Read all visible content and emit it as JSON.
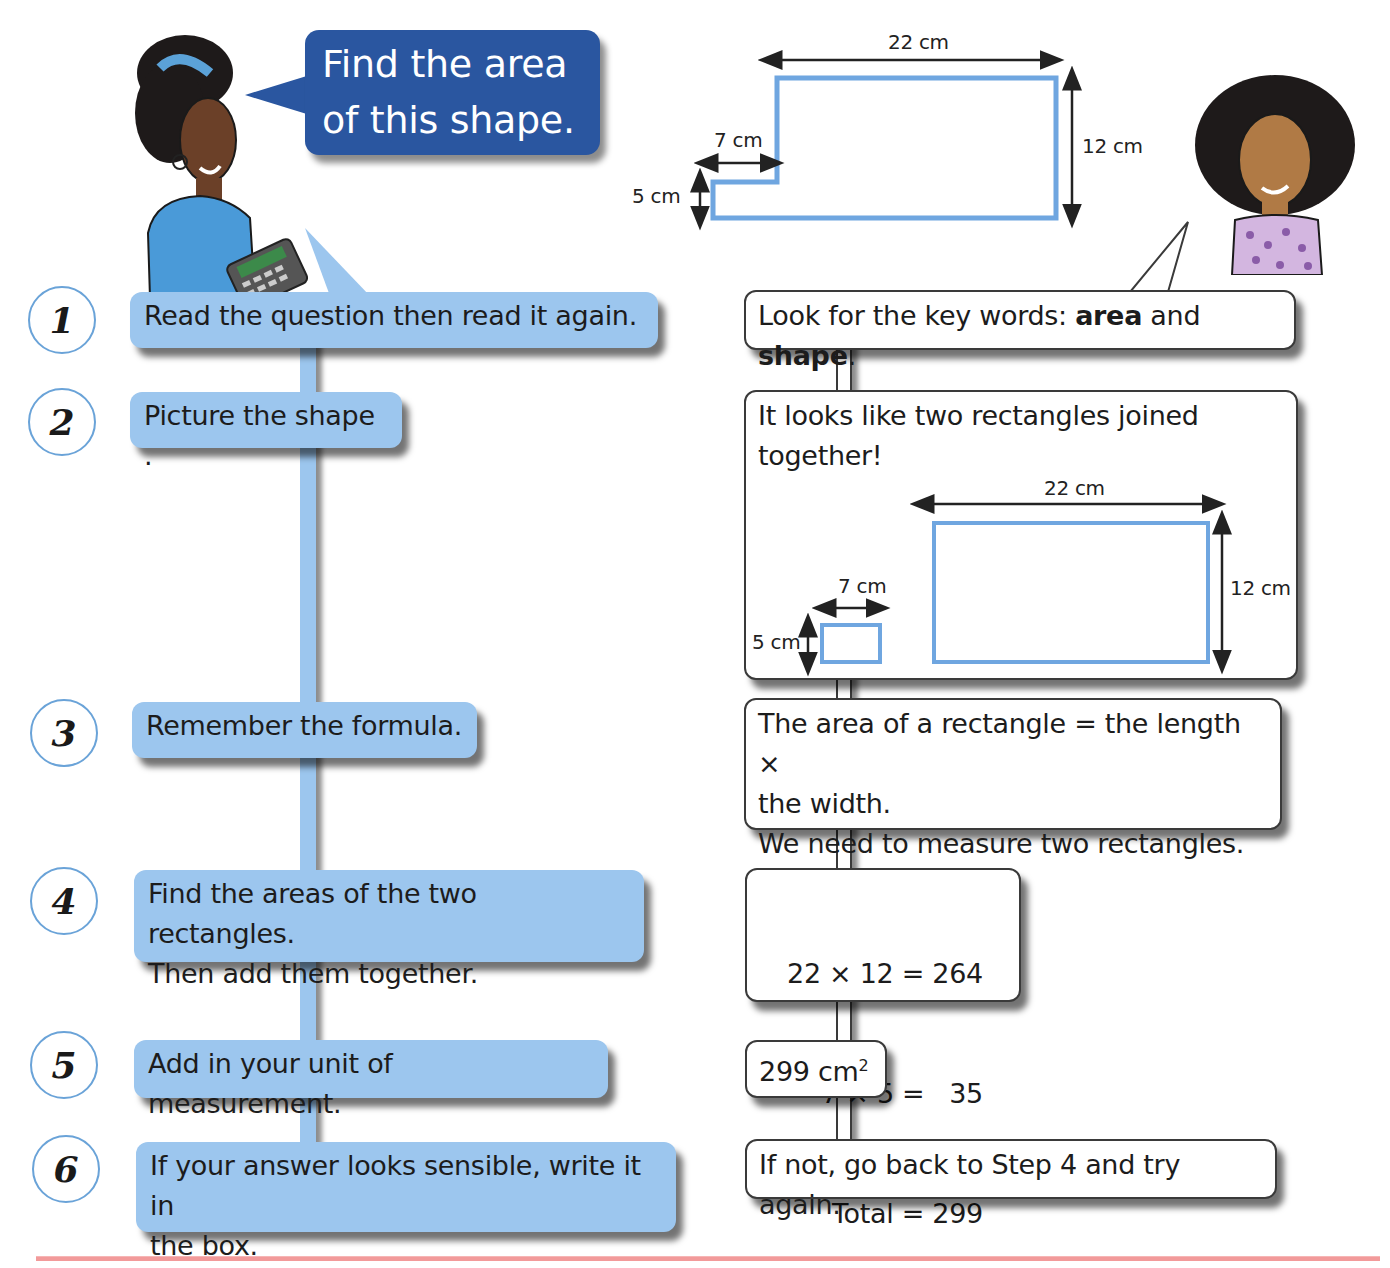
{
  "question_bubble": {
    "line1": "Find the area",
    "line2": "of this shape."
  },
  "shape_diagram": {
    "top_width": "22 cm",
    "step_width": "7 cm",
    "step_height": "5 cm",
    "right_height": "12 cm",
    "outline_color": "#6fa6e0"
  },
  "steps": [
    {
      "number": "1",
      "text": "Read the question then read it again."
    },
    {
      "number": "2",
      "text": "Picture the shape ."
    },
    {
      "number": "3",
      "text": "Remember the formula."
    },
    {
      "number": "4",
      "text_line1": "Find the areas of the two rectangles.",
      "text_line2": "Then add them together."
    },
    {
      "number": "5",
      "text": "Add in your unit of measurement."
    },
    {
      "number": "6",
      "text_line1": "If your answer looks sensible, write it in",
      "text_line2": "the box."
    }
  ],
  "answers": {
    "a1": {
      "prefix": "Look for the key words: ",
      "kw1": "area",
      "mid": " and ",
      "kw2": "shape",
      "suffix": "."
    },
    "a2": {
      "line1": "It looks like two rectangles joined",
      "line2": "together!",
      "big_width": "22 cm",
      "big_height": "12 cm",
      "small_width": "7 cm",
      "small_height": "5 cm"
    },
    "a3": {
      "line1": "The area of a rectangle = the length ×",
      "line2": "the width.",
      "line3": "We need to measure two rectangles."
    },
    "a4": {
      "line1": "22 × 12 = 264",
      "line2": "7 × 5 =   35",
      "line3": "Total = 299"
    },
    "a5": {
      "value": "299 cm",
      "sup": "2"
    },
    "a6": {
      "text": "If not, go back to Step 4 and try again."
    }
  },
  "colors": {
    "question_bubble": "#2a56a0",
    "step_box": "#9cc6ee",
    "circle_border": "#6aa3d8",
    "bottom_rule": "#f29a9a"
  }
}
